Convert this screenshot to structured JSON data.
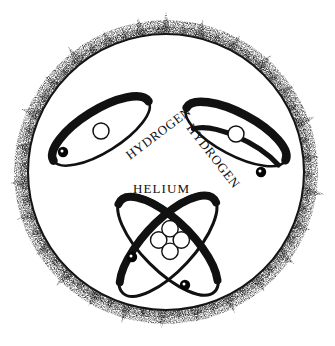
{
  "illustration": {
    "title_visible": false,
    "background_color": "#ffffff",
    "ink_color": "#000000",
    "subject": "sun-nuclear-fusion-diagram",
    "sun": {
      "name": "sun-disc",
      "center": {
        "x": 166,
        "y": 172
      },
      "radius": 138,
      "corona_name": "sun-corona",
      "corona_spike_count": 58,
      "outline_color": "#111111",
      "corona_color": "#2b2b2b"
    },
    "atoms": [
      {
        "id": "hydrogen-left",
        "label": "HYDROGEN",
        "label_rotation_deg": -37,
        "label_x": 130,
        "label_y": 160,
        "nucleus": {
          "type": "open-circle",
          "count": 1,
          "x": 101,
          "y": 131,
          "r": 8
        },
        "orbit": {
          "cx": 101,
          "cy": 131,
          "rx": 56,
          "ry": 21,
          "rotation_deg": -32
        },
        "electron": {
          "x": 63,
          "y": 152,
          "r": 5
        }
      },
      {
        "id": "hydrogen-right",
        "label": "HYDROGEN",
        "label_rotation_deg": 52,
        "label_x": 208,
        "label_y": 140,
        "nucleus": {
          "type": "open-circle",
          "count": 1,
          "x": 236,
          "y": 134,
          "r": 8
        },
        "orbit": {
          "cx": 236,
          "cy": 134,
          "rx": 56,
          "ry": 21,
          "rotation_deg": 28
        },
        "electron": {
          "x": 261,
          "y": 172,
          "r": 5
        }
      },
      {
        "id": "helium",
        "label": "HELIUM",
        "label_rotation_deg": 0,
        "label_x": 160,
        "label_y": 192,
        "nucleus": {
          "type": "four-circle-cluster",
          "count": 4,
          "x": 170,
          "y": 240,
          "r": 8
        },
        "orbits": [
          {
            "cx": 168,
            "cy": 245,
            "rx": 66,
            "ry": 26,
            "rotation_deg": -47
          },
          {
            "cx": 168,
            "cy": 245,
            "rx": 66,
            "ry": 26,
            "rotation_deg": 45
          }
        ],
        "electrons": [
          {
            "x": 132,
            "y": 257,
            "r": 5
          },
          {
            "x": 185,
            "y": 285,
            "r": 5
          }
        ]
      }
    ],
    "labels": {
      "hydrogen_left": "HYDROGEN",
      "hydrogen_right": "HYDROGEN",
      "helium": "HELIUM"
    }
  }
}
